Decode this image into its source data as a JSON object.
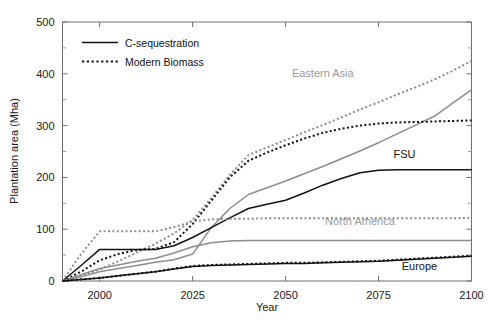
{
  "chart_data": {
    "type": "line",
    "title": "",
    "xlabel": "Year",
    "ylabel": "Plantation area (Mha)",
    "xlim": [
      1990,
      2100
    ],
    "ylim": [
      0,
      500
    ],
    "x_ticks": [
      2000,
      2025,
      2050,
      2075,
      2100
    ],
    "y_ticks": [
      0,
      100,
      200,
      300,
      400,
      500
    ],
    "y_minor_ticks": [
      50,
      150,
      250,
      350,
      450
    ],
    "grid": false,
    "legend": {
      "position": "top-left-inside",
      "entries": [
        {
          "label": "C-sequestration",
          "style": "solid"
        },
        {
          "label": "Modern Biomass",
          "style": "dotted"
        }
      ]
    },
    "annotations": [
      {
        "text": "Eastern Asia",
        "x": 2060,
        "y": 393,
        "color": "#9a9a9a"
      },
      {
        "text": "FSU",
        "x": 2082,
        "y": 238,
        "color": "#121212"
      },
      {
        "text": "North America",
        "x": 2070,
        "y": 108,
        "color": "#9a9a9a"
      },
      {
        "text": "Europe",
        "x": 2086,
        "y": 22,
        "color": "#121212"
      }
    ],
    "colors": {
      "dark": "#121212",
      "gray": "#8d8d8d",
      "axis": "#6e6e6e",
      "background": "#ffffff"
    },
    "x": [
      1990,
      1995,
      2000,
      2005,
      2010,
      2015,
      2020,
      2025,
      2030,
      2035,
      2040,
      2045,
      2050,
      2055,
      2060,
      2065,
      2070,
      2075,
      2080,
      2085,
      2090,
      2095,
      2100
    ],
    "series": [
      {
        "name": "Eastern Asia - Modern Biomass",
        "region": "Eastern Asia",
        "scenario": "Modern Biomass",
        "style": "dotted",
        "color": "#8d8d8d",
        "values": [
          0,
          10,
          22,
          38,
          55,
          72,
          92,
          118,
          160,
          205,
          243,
          258,
          272,
          287,
          301,
          316,
          331,
          345,
          360,
          374,
          389,
          406,
          425
        ]
      },
      {
        "name": "Eastern Asia - C-sequestration",
        "region": "Eastern Asia",
        "scenario": "C-sequestration",
        "style": "solid",
        "color": "#8d8d8d",
        "values": [
          0,
          8,
          18,
          24,
          30,
          36,
          41,
          52,
          103,
          140,
          167,
          180,
          193,
          207,
          221,
          236,
          251,
          267,
          284,
          301,
          318,
          344,
          369
        ]
      },
      {
        "name": "FSU - Modern Biomass",
        "region": "FSU",
        "scenario": "Modern Biomass",
        "style": "dotted",
        "color": "#121212",
        "values": [
          0,
          18,
          40,
          52,
          60,
          62,
          75,
          110,
          155,
          200,
          232,
          248,
          262,
          275,
          286,
          294,
          300,
          304,
          306,
          307,
          308,
          309,
          310
        ]
      },
      {
        "name": "FSU - C-sequestration",
        "region": "FSU",
        "scenario": "C-sequestration",
        "style": "solid",
        "color": "#121212",
        "values": [
          0,
          30,
          61,
          61,
          61,
          61,
          68,
          84,
          103,
          122,
          140,
          148,
          156,
          170,
          185,
          198,
          209,
          214,
          215,
          215,
          215,
          215,
          215
        ]
      },
      {
        "name": "North America - Modern Biomass",
        "region": "North America",
        "scenario": "Modern Biomass",
        "style": "dotted",
        "color": "#8d8d8d",
        "values": [
          0,
          52,
          96,
          96,
          96,
          96,
          104,
          115,
          119,
          120,
          120,
          121,
          121,
          121,
          121,
          121,
          121,
          121,
          121,
          121,
          121,
          121,
          122
        ]
      },
      {
        "name": "North America - C-sequestration",
        "region": "North America",
        "scenario": "C-sequestration",
        "style": "solid",
        "color": "#8d8d8d",
        "values": [
          0,
          12,
          24,
          31,
          38,
          44,
          54,
          66,
          74,
          77,
          78,
          78,
          78,
          78,
          78,
          78,
          78,
          78,
          78,
          78,
          78,
          78,
          78
        ]
      },
      {
        "name": "Europe - Modern Biomass",
        "region": "Europe",
        "scenario": "Modern Biomass",
        "style": "dotted",
        "color": "#121212",
        "values": [
          0,
          3,
          6,
          10,
          14,
          18,
          24,
          29,
          31,
          32,
          33,
          34,
          35,
          35,
          36,
          37,
          38,
          39,
          41,
          43,
          45,
          47,
          49
        ]
      },
      {
        "name": "Europe - C-sequestration",
        "region": "Europe",
        "scenario": "C-sequestration",
        "style": "solid",
        "color": "#121212",
        "values": [
          0,
          3,
          6,
          10,
          14,
          18,
          23,
          28,
          30,
          31,
          32,
          33,
          34,
          34,
          35,
          36,
          37,
          38,
          40,
          42,
          44,
          46,
          48
        ]
      }
    ]
  }
}
